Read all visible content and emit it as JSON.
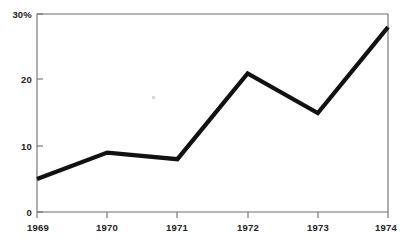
{
  "chart_data": {
    "type": "line",
    "title": "",
    "subtitle": "",
    "xlabel": "",
    "ylabel": "",
    "categories": [
      "1969",
      "1970",
      "1971",
      "1972",
      "1973",
      "1974"
    ],
    "x": [
      1969,
      1970,
      1971,
      1972,
      1973,
      1974
    ],
    "values": [
      5,
      9,
      8,
      21,
      15,
      28
    ],
    "series": [
      {
        "name": "",
        "values": [
          5,
          9,
          8,
          21,
          15,
          28
        ]
      }
    ],
    "ylim": [
      0,
      30
    ],
    "xlim": [
      1969,
      1974
    ],
    "y_ticks": [
      0,
      10,
      20,
      30
    ],
    "y_tick_labels": [
      "0",
      "10",
      "20",
      "30%"
    ],
    "x_ticks": [
      1969,
      1970,
      1971,
      1972,
      1973,
      1974
    ],
    "x_tick_labels": [
      "1969",
      "1970",
      "1971",
      "1972",
      "1973",
      "1974"
    ],
    "grid": false,
    "legend": "none",
    "annotations": [],
    "line_color": "#111111",
    "axis_color": "#6e6e6e",
    "background_color": "#ffffff"
  },
  "axis": {
    "y_labels": [
      {
        "text": "30%",
        "value": 30
      },
      {
        "text": "20",
        "value": 20
      },
      {
        "text": "10",
        "value": 10
      },
      {
        "text": "0",
        "value": 0
      }
    ],
    "x_labels": [
      {
        "text": "1969",
        "value": 1969
      },
      {
        "text": "1970",
        "value": 1970
      },
      {
        "text": "1971",
        "value": 1971
      },
      {
        "text": "1972",
        "value": 1972
      },
      {
        "text": "1973",
        "value": 1973
      },
      {
        "text": "1974",
        "value": 1974
      }
    ]
  }
}
